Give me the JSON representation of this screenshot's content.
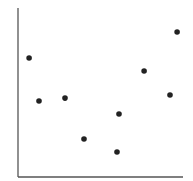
{
  "chart_data": {
    "type": "scatter",
    "title": "",
    "xlabel": "",
    "ylabel": "",
    "xlim": [
      0,
      10
    ],
    "ylim": [
      0,
      10
    ],
    "grid": false,
    "legend": null,
    "ticks": false,
    "series": [
      {
        "name": "points",
        "color": "#222222",
        "x": [
          0.67,
          1.27,
          2.85,
          4.0,
          6.0,
          6.12,
          7.64,
          9.21,
          9.64
        ],
        "y": [
          7.04,
          4.5,
          4.67,
          2.25,
          1.48,
          3.73,
          6.27,
          4.85,
          8.58
        ]
      }
    ]
  },
  "style": {
    "axis_color": "#555555",
    "background": "#ffffff"
  }
}
